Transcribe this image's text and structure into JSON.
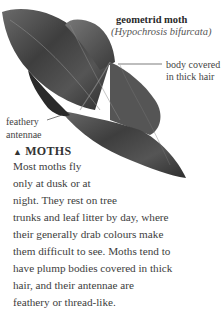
{
  "caption": {
    "title": "geometrid moth",
    "latin_name": "(Hypochrosis bifurcata)"
  },
  "annotations": {
    "body_label_line1": "body covered",
    "body_label_line2": "in thick hair",
    "antennae_label_line1": "feathery",
    "antennae_label_line2": "antennae"
  },
  "section": {
    "marker": "▲",
    "heading": "MOTHS",
    "lines": [
      "Most moths fly",
      "only at dusk or at",
      "night. They rest on tree",
      "trunks and leaf litter by day, where",
      "their generally drab colours make",
      "them difficult to see. Moths tend to",
      "have plump bodies covered in thick",
      "hair, and their antennae are",
      "feathery or thread-like."
    ]
  },
  "image": {
    "subject": "moth-photo",
    "palette": [
      "#2b2b2b",
      "#5a5a5a",
      "#8a8a8a"
    ]
  }
}
